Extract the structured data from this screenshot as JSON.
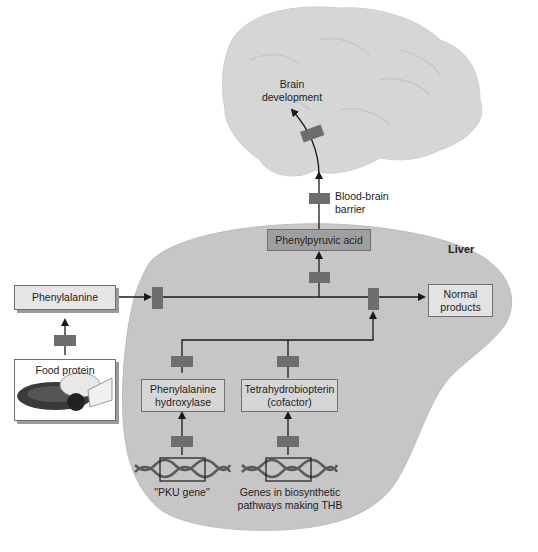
{
  "diagram": {
    "regions": {
      "brain": {
        "label": "Brain development"
      },
      "liver": {
        "label": "Liver"
      }
    },
    "nodes": {
      "phenylalanine": "Phenylalanine",
      "food_protein": "Food protein",
      "phenylpyruvic_acid": "Phenylpyruvic acid",
      "normal_products": "Normal products",
      "pah_line1": "Phenylalanine",
      "pah_line2": "hydroxylase",
      "thb_line1": "Tetrahydrobiopterin",
      "thb_line2": "(cofactor)",
      "pku_gene": "\"PKU gene\"",
      "genes_line1": "Genes in biosynthetic",
      "genes_line2": "pathways making THB"
    },
    "annotations": {
      "bbb_line1": "Blood-brain",
      "bbb_line2": "barrier",
      "brain_line1": "Brain",
      "brain_line2": "development",
      "normal_line1": "Normal",
      "normal_line2": "products"
    },
    "colors": {
      "brain_fill": "#d4d4d4",
      "liver_fill": "#c4c4c4",
      "box_fill": "#e6e6e6",
      "block_fill": "#6e6e6e",
      "arrow": "#1a1a1a"
    }
  }
}
